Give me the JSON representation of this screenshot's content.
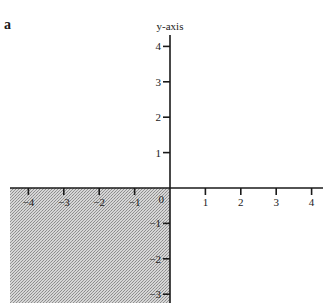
{
  "figure": {
    "label": "a",
    "y_axis_title": "y-axis",
    "origin_label": "0",
    "shaded_region": "third quadrant (x < 0, y < 0)",
    "colors": {
      "axis": "#1a1a1a",
      "shading": "#b8b8b8",
      "background": "#ffffff"
    }
  },
  "x_ticks": [
    {
      "value": -4,
      "label": "−4"
    },
    {
      "value": -3,
      "label": "−3"
    },
    {
      "value": -2,
      "label": "−2"
    },
    {
      "value": -1,
      "label": "−1"
    },
    {
      "value": 1,
      "label": "1"
    },
    {
      "value": 2,
      "label": "2"
    },
    {
      "value": 3,
      "label": "3"
    },
    {
      "value": 4,
      "label": "4"
    }
  ],
  "y_ticks": [
    {
      "value": 4,
      "label": "4"
    },
    {
      "value": 3,
      "label": "3"
    },
    {
      "value": 2,
      "label": "2"
    },
    {
      "value": 1,
      "label": "1"
    },
    {
      "value": -1,
      "label": "−1"
    },
    {
      "value": -2,
      "label": "−2"
    },
    {
      "value": -3,
      "label": "−3"
    }
  ]
}
